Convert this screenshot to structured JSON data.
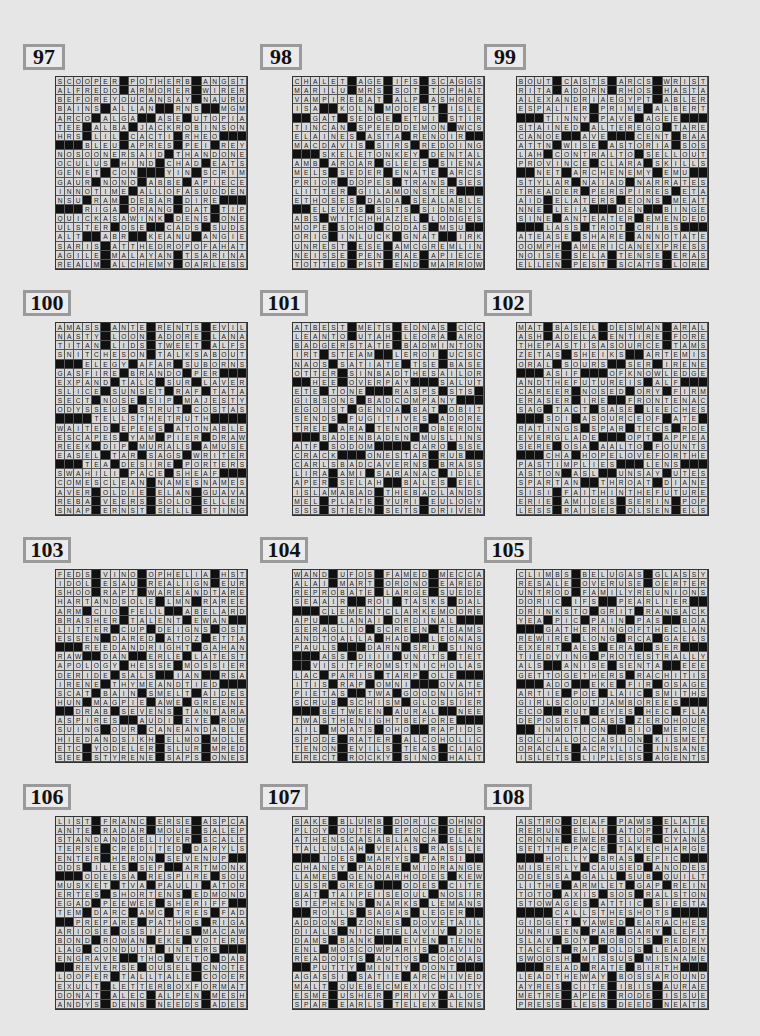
{
  "page": {
    "type": "crossword-solutions",
    "puzzles": [
      {
        "number": "97",
        "rows": [
          "SCOOPER#POTHERB#ANGST",
          "ALFREDO#ARMORER#WIRER",
          "BEFOREYOUCANSAY#NAURU",
          "BAINS#ALLAN##RNS##MGM",
          "ARCO#ALGA##ASE#UTOPIA",
          "TEE#ALBA#JACKROBINSON",
          "HRS#LIL#CACTI#RHEO###",
          "###BLEU#APRES#PEI#REY",
          "NOSOONERSAID#THANDONE",
          "OCULUS#HIND#CHAD#EATS",
          "GENET#CON###YIN#SCRIM",
          "GAUR#NONO#ABBE#APIECE",
          "INNOTIME#ALLOFASUDDEN",
          "NSU#RAM#DEBAR#DIRE###",
          "###RIGA#ORANG#DAT#TIP",
          "QUICKASAWINK#DENS#ONE",
          "ULSTER#OSE##CADS#SUDS",
          "ALT##ABR##KEANU#ANGIE",
          "SARIS#ATTHEDROPOFAHAT",
          "AGILE#MALAYAN#TSARINA",
          "REALM#ALCHEMY#OARLESS"
        ]
      },
      {
        "number": "98",
        "rows": [
          "CHALET#AGE#IFS#SCAGGS",
          "MARILU#MRS#SOT#TOPHAT",
          "VAMPIREBAT#ALP#ASHORE",
          "ISA##KOLN#MODEST#ISLE",
          "##GAT#SEDGE#ETUI#STIR",
          "TINCAN#SPEEDDEMON#WCS",
          "ELAINES#ASTA#RENOIR##",
          "MACDAVIS#SIRS#REDOING",
          "###SKELETONKEY#DENTAL",
          "AMB#AROAR#GLEES#SIENA",
          "MELS#SEDER#ENATE#ARCS",
          "PRIOR#DOPES#TRANS#SES",
          "LITTER#GILAMONSTER###",
          "ETHOSES#DADA#SEALABLE",
          "##ELEVES#SSTS#SIDNEYS",
          "ABS#WITCHHAZEL#LODGES",
          "MOPE#SOHO#CODAS#MSU##",
          "ORIG#INLUCK#GNAT##IRK",
          "UNREST#ESE#AMCGREMLIN",
          "NEISSE#PEN#RAE#APIECE",
          "TOTTED#PST#END#MARROW"
        ]
      },
      {
        "number": "99",
        "rows": [
          "BOUT#CASTS#ARCS#WRIST",
          "RITA#ADORN#RHOS#HASTA",
          "ALEXANDRIAEGYPT#ABLER",
          "ESPALIER#PRIME#ALBERT",
          "###TINNY#PAVE#AGEE###",
          "STAINED#ALTEREGO#TARE",
          "CANOE##AVE###CENT#BAA",
          "ATTN#WISE#ASTORIA#SOS",
          "LAH#CONTRALTO#SELLOUT",
          "PROVINCE#CLARA#SKILLS",
          "##NET#ARCHENEMY#EMU##",
          "STYLAR#NAIAD#NARRATES",
          "TREADER#PERSPIRES#ETA",
          "AID#ELATERS#EONS#MEAT",
          "NNE#LEIA###DEN##BINGE",
          "SINE#ANTEATER#EMENDED",
          "###LASS#TROT#CRIBS###",
          "ATEASE#SHARE#ANNOTATE",
          "OOMPH#AMERICANEXPRESS",
          "NOISE#SELA#TENSE#ERAS",
          "ELLEN#PEST#SCATS#LORE"
        ]
      },
      {
        "number": "100",
        "rows": [
          "AMASS#ANTE#RENTS#EVIL",
          "NASTY#LOON#ADORE#LANA",
          "TITAN#LIDS#TWEET#ALFS",
          "SNITCHESON#TALKSABOUT",
          "###ELEGY#AFAR#SUBORNS",
          "GASFIRE#BRANDO#PER###",
          "EXPAND#TALC#SUR#LAVER",
          "SLICE#SUNSET#RAF#TATA",
          "SECT#NOSE#SIP#MAJESTY",
          "ODYSSEUS#STRUT#COSTAS",
          "####TELLSTHETRUTH####",
          "WAITED#EPEES#ATONABLE",
          "ESCAPES#YAM#PIER#DRAW",
          "REEK#DIP#MURALS#AMUSE",
          "EASEL#TAR#SAGS#WRITER",
          "###TEA#DESIRE#PORTERS",
          "SWAHILI#PACE#SHEAF###",
          "COMESCLEAN#NAMESNAMES",
          "AVER#OLDIE#ELAN#GUAVA",
          "REBA#VEERS#SOLO#ELLEN",
          "SNAP#ERNST#SELL#STING"
        ]
      },
      {
        "number": "101",
        "rows": [
          "ATBEST#METS#EDNAS#CCC",
          "LEANTO#UTAH#LEORA#ARO",
          "BADGERSTATE#BADMINTON",
          "IRT#STEAM##LEROI#UCSC",
          "NAOS#SATIATE#TSE#BASE",
          "OTTER#SINBADTHESAILOR",
          "##HEE#OVERPAY###SALUT",
          "ETE#TONE###RASPS#STS#",
          "GIBSONS#BADCOMPANY###",
          "EGOIST#GENOA#BAT#OBIT",
          "SENDS#FUGITIVES#ADORE",
          "TREE#ARA#TENOR#OBERON",
          "###BADENBADEN#MUSLINS",
          "ATF#SODOM####CARO#SSE",
          "CRACK###ONESTAR#RUB##",
          "CARLSBADCAVERNS#BRASS",
          "LIRA#AMI#SARANAC#IDLE",
          "APER#SELAH##BALES#EEL",
          "ISLAMABAD#THEBADLANDS",
          "MEL#PLATE#YURI#EULOGY",
          "SSS#STEEN#SETS#DRIVEN"
        ]
      },
      {
        "number": "102",
        "rows": [
          "MAT#BASEL#DESMAN#ARAL",
          "ASH#ADELA#ENTIRE#FORE",
          "THEPASTISASOURCE#TAMS",
          "ZETAS#SHEIKS##ARTEMIS",
          "ORAL#SOURS##SER#IRENE",
          "###ASIF###OFKNOWLEDGE",
          "ANDTHEFUTUREIS#ALF###",
          "CAREER#NOSED#ORY#FIRM",
          "ERASER#IRE##FRONTENAC",
          "SAG#TACT#SASE#LEECHES",
          "###SDI#ASOURCEOF#ATE#",
          "RATINGS#SPAR#TECS#ROE",
          "EVERGLADE###OPT#APPEAL",
          "SERE#OSA#AALTO#FOUNTS",
          "###CHA#HOPELOVEFORTHE",
          "PASTIMPLIES###LENS###",
          "ASTON#ASL##UNSAY#UTES",
          "SPARTAN##THROAT#DIANE",
          "SISI#FAITHINTHEFUTURE",
          "ERIE#AMIDES#SERIN#POP",
          "LESS#RAISES#OLSEN#ELS"
        ]
      },
      {
        "number": "103",
        "rows": [
          "FEDS#VINO#OPHELIA#HST",
          "IDOL#ESAU#REALIGN#EUR",
          "SHOO#RAPT#WAREANDTARE",
          "HARTANDSOLE#LMN#RAREE",
          "ARM#CIO#FELL##ABELARD",
          "BRASHER#TALENT#EWAN##",
          "LITTER#CUP#DEIGNS#OST",
          "ESSEN#DARED#ATOZ#ETTA",
          "###REEDANDRIGHT#GAHAN",
          "RAW##DAN##ERLE#LATEST",
          "APOLOGY#HESSE#MOSSIER",
          "DERIDE#SALS##IAN##RSA",
          "IRENE#THYMEANDTIED###",
          "SCAT#BAIN#SMELT#AIDES",
          "HUN#MAGPIE#AWE#GREENE",
          "##DRAB#SEVENS#TANTARA",
          "ASPIRES##AUDI#EYE#ROW",
          "SUING#OUR#CANEANDABLE",
          "HIEDANDSIKH#ELMO#MOLE",
          "ETC#YODELER#SLUR#MRED",
          "SEE#STYRENE#SAPS#ONES"
        ]
      },
      {
        "number": "104",
        "rows": [
          "WAND#UFOS#FAMED#MECCA",
          "ALAI#MART#ORONO#EARED",
          "REPROBATE#LARGE#SUEDE",
          "SEAAIR##ROI#TASKS#DAL",
          "###CLEMENTCLARKEMOORE",
          "APU##LANAI#ORDINAL###",
          "SERAGLIO#SCREEN#TEAMS",
          "ANDTOALLA#HAD##LEONAS",
          "PAULS###DARN#SRI#SING",
          "###ASS#DIII#UNITS#TET",
          "##VISITFROMSTNICHOLAS",
          "LAC#PARIS#TARP#OLE###",
          "ITIS#RAP#OMNI###OVATE",
          "PIETAS##TWA#GOODNIGHT",
          "SCRUB#SCHISM#GLOSSIER",
          "###BETWEEN#AURAL##NEE",
          "TWASTHENIGHTBEFORE###",
          "AIL#MOATS#OHO##RAPIDS",
          "SPODE#RATER#ALCOHOLIC",
          "TENON#EVILS#TEAS#CIAO",
          "ERECT#ROCKY#SINO#HALT"
        ]
      },
      {
        "number": "105",
        "rows": [
          "CLIMBS#BELUGAS#GLASSY",
          "RESALE#OVERUSE#OERTER",
          "UNTROD#FAMILYREUNIONS",
          "DORIC#IFS##PEARLIER##",
          "DRINKSTO#GRIT#RANSACK",
          "YEA#PIC#PAIN#PAS##BOA",
          "###GATHERINGOFTHECLAN",
          "REWIRE#LONG#RCA#GAELS",
          "EXERT#AES#ERA##SER###",
          "TIEDYING#PROTESTRALLY",
          "ALS##ANISE#SENTA##EEE",
          "GETTOGETHERS#RACHITIS",
          "###ADO##EKE#FIR#OSAGE",
          "ARTIE#POE#LAIC#SMITHS",
          "GIRLSCOUTJAMBOREES###",
          "ECO##RUT#EYES#HEC#FLA",
          "DEPOSES#CASS#ZEROHOUR",
          "##INMOTION##BIO#MERCE",
          "SOCIALOCCASION#KISMET",
          "ORACLE#ACRYLIC#INSANE",
          "ISLETS#LIPLESS#AGENTS"
        ]
      },
      {
        "number": "106",
        "rows": [
          "LIST#FRANC#ERSE#ASPCA",
          "ANTE#RADAR#MOUE#SALEP",
          "STANDANDDELIVER#SCALE",
          "TERSE#CREDITED#DARYLS",
          "ENTER#HERON#SEVENUP##",
          "DDS#ILES#SEP##ARTMONK",
          "###ODESSA#RESPIRE#SOU",
          "MUSKET#TVA#PAULI#ATOR",
          "ERTES#SHORTENS#EDMOND",
          "EGAD#PEEWEE#SHERIFF##",
          "TEM#DARC#AMC#TRES#FAD",
          "##PREPARE#PATHOS#RIGA",
          "ARIOSE#OSSIFIES#MACAW",
          "BOND#ROWAN#EKE#VOTERS",
          "LAG#CONDUIT#INTERS###",
          "ENGRAVE##THO#VETO#DAB",
          "##REVERSE#OUSEL#CNOTE",
          "LOOPER#TALLTALE#COOER",
          "EXULT#LETTERBOXFORMAT",
          "DONAT#ALEC#ALPEN#MESH",
          "ANDYS#DENS#NEEDS#ADES"
        ]
      },
      {
        "number": "107",
        "rows": [
          "SAKE#BLURB#DORIC#OHNO",
          "PLOY#OUTER#EPOCH#DEER",
          "ATHENSCASABLANCA#ELAN",
          "TALLULAH#VEALS#RASSLE",
          "###IDES#MARYS#FARSI##",
          "CHANEY#PADRE#MIDRANGE",
          "LAMES#GENOARHODES#KEW",
          "USSR#GREG###ODES#CITE",
          "BAT#TAIPEISEOUL#NOSIR",
          "STEPHENS#NARKS#LEMANS",
          "##ROILS#SAGAS#LEGER##",
          "ADDONS#ZONES#DOVETAIL",
          "DIALS#NICETELAVIV#JOE",
          "DAMS#BANK###EVEN#TENN",
          "ENL#MOSCOWPARIS#DAVID",
          "READOUTS#AUTOS#COCOAS",
          "##PUTTY#MINTY#DONT###",
          "AGASSI#SATIE#ARCHIVED",
          "MALT#QUEBECMEXICOCITY",
          "ESME#USHER#PRIVY#ALOE",
          "SPAR#EARLS#TELEX#LENS"
        ]
      },
      {
        "number": "108",
        "rows": [
          "ASTRO#DEAF#PAWS#ELATE",
          "RERUN#ELLI#ATOP#TALIA",
          "CRONE#EWER#SLUR#CYANS",
          "SETTHEPACE#TAKECHARGE",
          "###HOLLY#BRAS#EPIC###",
          "MISERLY#CAUSED#ANODES",
          "ODESSA#GALL#SUB#QUILT",
          "LITHE#ARMLET#GAP#REIN",
          "TOTO#AXIS#SOS#RALSTON",
          "STOWAGES#ATTIC#SIESTA",
          "####CALLSTHESHOTS####",
          "GIDGET#YAWED#EARACHES",
          "UNRISEN#PAR#GARY#LEFT",
          "SLAV#SOY#ROBOTS#REDRY",
          "TACET#RAP#OLDS#LEADEN",
          "SWOOSH#MISSUS#MISNAME",
          "###READ#RATE#BIRTH###",
          "LEADTHEWAY#BOSSAROUND",
          "AYRES#CITE#IBIS#AURAE",
          "METRE#APER#RODE#ISSUE",
          "PRESS#LESS#DEED#NEATS"
        ]
      }
    ]
  }
}
